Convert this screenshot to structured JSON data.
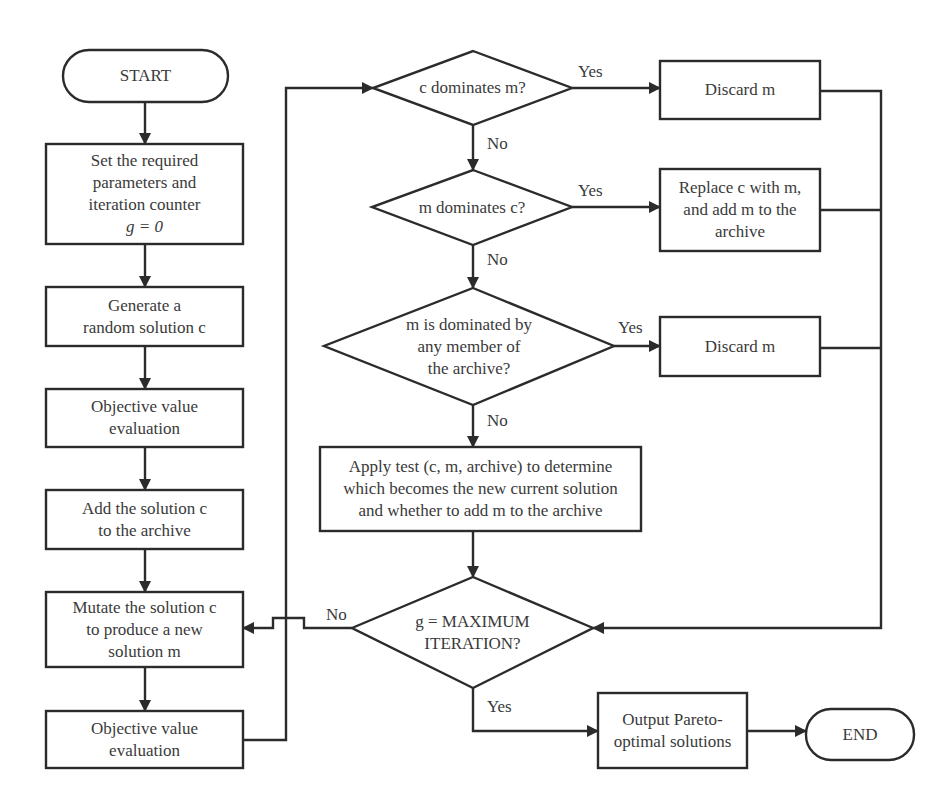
{
  "diagram": {
    "type": "flowchart",
    "colors": {
      "line": "#2b2b2b",
      "text": "#3a3a3a",
      "background": "#ffffff"
    },
    "terminals": {
      "start": "START",
      "end": "END"
    },
    "left_column": {
      "set_params": [
        "Set the required",
        "parameters and",
        "iteration counter",
        "g = 0"
      ],
      "generate": [
        "Generate a",
        "random solution c"
      ],
      "objective_eval_1": [
        "Objective value",
        "evaluation"
      ],
      "add_archive": [
        "Add the solution c",
        "to the archive"
      ],
      "mutate": [
        "Mutate the solution c",
        "to produce a new",
        "solution m"
      ],
      "objective_eval_2": [
        "Objective value",
        "evaluation"
      ]
    },
    "decisions": {
      "c_dominates_m": "c dominates m?",
      "m_dominates_c": "m dominates c?",
      "m_dominated_by_archive": [
        "m is dominated by",
        "any member of",
        "the archive?"
      ],
      "max_iteration": [
        "g = MAXIMUM",
        "ITERATION?"
      ]
    },
    "actions": {
      "discard_1": "Discard m",
      "replace": [
        "Replace c with m,",
        "and add m to the",
        "archive"
      ],
      "discard_2": "Discard m",
      "apply_test": [
        "Apply test (c, m, archive) to determine",
        "which becomes the new current solution",
        "and whether to add m to the archive"
      ],
      "output": [
        "Output Pareto-",
        "optimal solutions"
      ]
    },
    "edge_labels": {
      "yes_1": "Yes",
      "no_1": "No",
      "yes_2": "Yes",
      "no_2": "No",
      "yes_3": "Yes",
      "no_3": "No",
      "no_4": "No",
      "yes_4": "Yes"
    }
  }
}
